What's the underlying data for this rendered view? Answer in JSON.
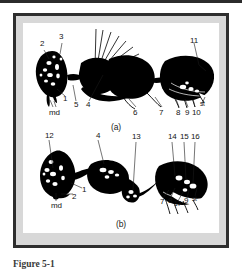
{
  "document": {
    "caption": "Figure 5-1",
    "colors": {
      "page_background": "#ffffff",
      "frame_border": "#2e2e2e",
      "frame_mat": "#d8d8d8",
      "plate_background": "#ffffff",
      "ink": "#000000",
      "label_text": "#141414",
      "caption_text": "#3a3a3a"
    }
  },
  "figure": {
    "panels": [
      {
        "id": "a",
        "panel_label": "(a)",
        "subject": "insect-lateral-habitus-drawing",
        "callouts": [
          {
            "label": "2",
            "x": 17,
            "y": 22
          },
          {
            "label": "3",
            "x": 36,
            "y": 14
          },
          {
            "label": "1",
            "x": 40,
            "y": 74
          },
          {
            "label": "5",
            "x": 51,
            "y": 80
          },
          {
            "label": "4",
            "x": 63,
            "y": 80
          },
          {
            "label": "md",
            "x": 28,
            "y": 86
          },
          {
            "label": "6",
            "x": 110,
            "y": 86
          },
          {
            "label": "7",
            "x": 136,
            "y": 86
          },
          {
            "label": "8",
            "x": 154,
            "y": 86
          },
          {
            "label": "9",
            "x": 163,
            "y": 86
          },
          {
            "label": "10",
            "x": 170,
            "y": 86
          },
          {
            "label": "st",
            "x": 176,
            "y": 77
          },
          {
            "label": "11",
            "x": 168,
            "y": 14
          }
        ]
      },
      {
        "id": "b",
        "panel_label": "(b)",
        "subject": "insect-lateral-habitus-drawing",
        "callouts": [
          {
            "label": "12",
            "x": 22,
            "y": 4
          },
          {
            "label": "4",
            "x": 72,
            "y": 4
          },
          {
            "label": "13",
            "x": 110,
            "y": 6
          },
          {
            "label": "14",
            "x": 146,
            "y": 6
          },
          {
            "label": "15",
            "x": 158,
            "y": 6
          },
          {
            "label": "16",
            "x": 169,
            "y": 6
          },
          {
            "label": "1",
            "x": 57,
            "y": 61
          },
          {
            "label": "2",
            "x": 48,
            "y": 66
          },
          {
            "label": "md",
            "x": 30,
            "y": 74
          },
          {
            "label": "7",
            "x": 138,
            "y": 71
          },
          {
            "label": "8",
            "x": 146,
            "y": 70
          },
          {
            "label": "17",
            "x": 152,
            "y": 73
          },
          {
            "label": "9",
            "x": 162,
            "y": 71
          },
          {
            "label": "st",
            "x": 169,
            "y": 69
          }
        ]
      }
    ]
  }
}
